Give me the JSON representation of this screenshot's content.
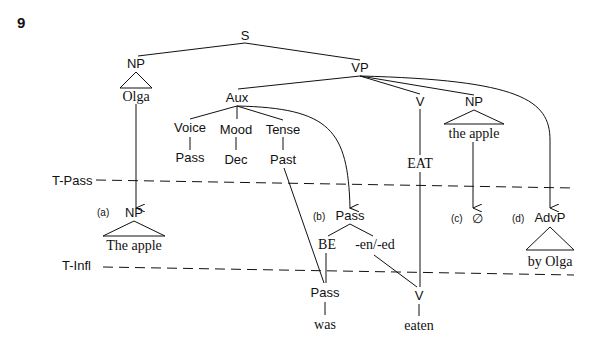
{
  "example_number": "9",
  "root": "S",
  "subject": {
    "label": "NP",
    "text": "Olga"
  },
  "vp": {
    "label": "VP"
  },
  "aux": {
    "label": "Aux",
    "voice": "Voice",
    "voice_val": "Pass",
    "mood": "Mood",
    "mood_val": "Dec",
    "tense": "Tense",
    "tense_val": "Past"
  },
  "verb": {
    "label": "V",
    "text": "EAT"
  },
  "object": {
    "label": "NP",
    "text": "the apple"
  },
  "levels": {
    "t_pass": "T-Pass",
    "t_infl": "T-Infl"
  },
  "derived": {
    "a": {
      "tag": "(a)",
      "label": "NP",
      "text": "The apple"
    },
    "b": {
      "tag": "(b)",
      "label": "Pass",
      "left": "BE",
      "right": "-en/-ed"
    },
    "c": {
      "tag": "(c)",
      "label": "∅"
    },
    "d": {
      "tag": "(d)",
      "label": "AdvP",
      "text": "by Olga"
    }
  },
  "surface": {
    "pass": "Pass",
    "was": "was",
    "v": "V",
    "eaten": "eaten"
  }
}
